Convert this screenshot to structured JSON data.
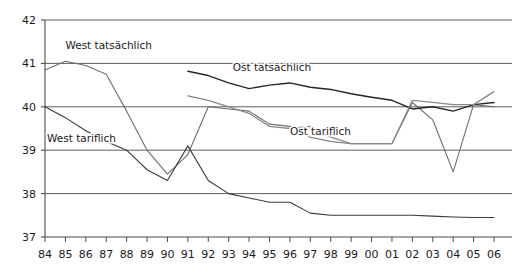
{
  "chart_data": {
    "type": "line",
    "title": "",
    "subtitle": "",
    "xlabel": "",
    "ylabel": "",
    "xlim": [
      1984,
      2006
    ],
    "ylim": [
      37,
      42
    ],
    "yticks": [
      37,
      38,
      39,
      40,
      41,
      42
    ],
    "ytick_labels": [
      "37",
      "38",
      "39",
      "40",
      "41",
      "42"
    ],
    "grid": true,
    "grid_axis": "y",
    "legend_position": "inline-annotations",
    "x": [
      1984,
      1985,
      1986,
      1987,
      1988,
      1989,
      1990,
      1991,
      1992,
      1993,
      1994,
      1995,
      1996,
      1997,
      1998,
      1999,
      2000,
      2001,
      2002,
      2003,
      2004,
      2005,
      2006
    ],
    "xtick_labels": [
      "84",
      "85",
      "86",
      "87",
      "88",
      "89",
      "90",
      "91",
      "92",
      "93",
      "94",
      "95",
      "96",
      "97",
      "98",
      "99",
      "00",
      "01",
      "02",
      "03",
      "04",
      "05",
      "06"
    ],
    "series": [
      {
        "name": "West tatsächlich",
        "color": "#6e6e6e",
        "width": 1.1,
        "label_x": 1985.0,
        "label_y": 41.33,
        "label_anchor": "start",
        "values": [
          40.85,
          41.05,
          40.95,
          40.75,
          39.9,
          39.0,
          38.45,
          38.9,
          40.0,
          39.95,
          39.9,
          39.6,
          39.55,
          39.3,
          39.2,
          39.15,
          39.15,
          39.15,
          40.1,
          39.7,
          38.5,
          40.05,
          40.0
        ]
      },
      {
        "name": "West tariflich",
        "color": "#3a3a3a",
        "width": 1.1,
        "label_x": 1984.1,
        "label_y": 39.2,
        "label_anchor": "start",
        "values": [
          40.0,
          39.75,
          39.45,
          39.2,
          39.0,
          38.55,
          38.3,
          39.1,
          38.3,
          38.0,
          37.9,
          37.8,
          37.8,
          37.55,
          37.5,
          37.5,
          37.5,
          37.5,
          37.5,
          37.48,
          37.46,
          37.45,
          37.45
        ]
      },
      {
        "name": "Ost tatsächlich",
        "color": "#262626",
        "width": 1.4,
        "label_x": 1993.2,
        "label_y": 40.82,
        "label_anchor": "start",
        "start_index": 7,
        "values": [
          null,
          null,
          null,
          null,
          null,
          null,
          null,
          40.82,
          40.72,
          40.55,
          40.42,
          40.5,
          40.55,
          40.45,
          40.4,
          40.3,
          40.22,
          40.15,
          39.95,
          40.0,
          39.9,
          40.05,
          40.1
        ]
      },
      {
        "name": "Ost tariflich",
        "color": "#8a8a8a",
        "width": 1.3,
        "label_x": 1996.0,
        "label_y": 39.35,
        "label_anchor": "start",
        "start_index": 7,
        "values": [
          null,
          null,
          null,
          null,
          null,
          null,
          null,
          40.25,
          40.15,
          40.0,
          39.85,
          39.55,
          39.5,
          39.55,
          39.3,
          39.15,
          39.15,
          39.15,
          40.15,
          40.1,
          40.05,
          40.05,
          40.35
        ]
      }
    ],
    "annotations": [
      {
        "text": "West tatsächlich",
        "x": 1985.0,
        "y": 41.33
      },
      {
        "text": "West tariflich",
        "x": 1984.1,
        "y": 39.2
      },
      {
        "text": "Ost tatsächlich",
        "x": 1993.2,
        "y": 40.82
      },
      {
        "text": "Ost tariflich",
        "x": 1996.0,
        "y": 39.35
      }
    ],
    "colors": {
      "axis": "#4d4d4d",
      "grid": "#4d4d4d",
      "background": "#ffffff",
      "text": "#1a1a1a"
    }
  }
}
